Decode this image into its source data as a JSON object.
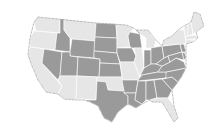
{
  "map": {
    "type": "choropleth",
    "region": "United States (contiguous)",
    "legend": [],
    "colors": {
      "light": "#e6e6e6",
      "dark": "#9a9a9a",
      "border": "#ffffff",
      "background": "#ffffff"
    },
    "states": [
      {
        "id": "WA",
        "shade": "light"
      },
      {
        "id": "OR",
        "shade": "light"
      },
      {
        "id": "CA",
        "shade": "light"
      },
      {
        "id": "ID",
        "shade": "dark"
      },
      {
        "id": "NV",
        "shade": "dark"
      },
      {
        "id": "MT",
        "shade": "light"
      },
      {
        "id": "WY",
        "shade": "dark"
      },
      {
        "id": "UT",
        "shade": "dark"
      },
      {
        "id": "AZ",
        "shade": "light"
      },
      {
        "id": "CO",
        "shade": "dark"
      },
      {
        "id": "NM",
        "shade": "light"
      },
      {
        "id": "ND",
        "shade": "dark"
      },
      {
        "id": "SD",
        "shade": "dark"
      },
      {
        "id": "NE",
        "shade": "dark"
      },
      {
        "id": "KS",
        "shade": "dark"
      },
      {
        "id": "OK",
        "shade": "light"
      },
      {
        "id": "TX",
        "shade": "dark"
      },
      {
        "id": "MN",
        "shade": "light"
      },
      {
        "id": "IA",
        "shade": "dark"
      },
      {
        "id": "MO",
        "shade": "light"
      },
      {
        "id": "AR",
        "shade": "dark"
      },
      {
        "id": "LA",
        "shade": "dark"
      },
      {
        "id": "WI",
        "shade": "dark"
      },
      {
        "id": "IL",
        "shade": "light"
      },
      {
        "id": "MI",
        "shade": "light"
      },
      {
        "id": "IN",
        "shade": "dark"
      },
      {
        "id": "OH",
        "shade": "dark"
      },
      {
        "id": "KY",
        "shade": "dark"
      },
      {
        "id": "TN",
        "shade": "dark"
      },
      {
        "id": "MS",
        "shade": "dark"
      },
      {
        "id": "AL",
        "shade": "dark"
      },
      {
        "id": "GA",
        "shade": "dark"
      },
      {
        "id": "FL",
        "shade": "light"
      },
      {
        "id": "SC",
        "shade": "dark"
      },
      {
        "id": "NC",
        "shade": "dark"
      },
      {
        "id": "VA",
        "shade": "dark"
      },
      {
        "id": "WV",
        "shade": "dark"
      },
      {
        "id": "PA",
        "shade": "dark"
      },
      {
        "id": "NY",
        "shade": "light"
      },
      {
        "id": "NJ",
        "shade": "dark"
      },
      {
        "id": "MD",
        "shade": "dark"
      },
      {
        "id": "DE",
        "shade": "dark"
      },
      {
        "id": "CT",
        "shade": "light"
      },
      {
        "id": "RI",
        "shade": "light"
      },
      {
        "id": "MA",
        "shade": "light"
      },
      {
        "id": "VT",
        "shade": "light"
      },
      {
        "id": "NH",
        "shade": "light"
      },
      {
        "id": "ME",
        "shade": "light"
      }
    ]
  }
}
